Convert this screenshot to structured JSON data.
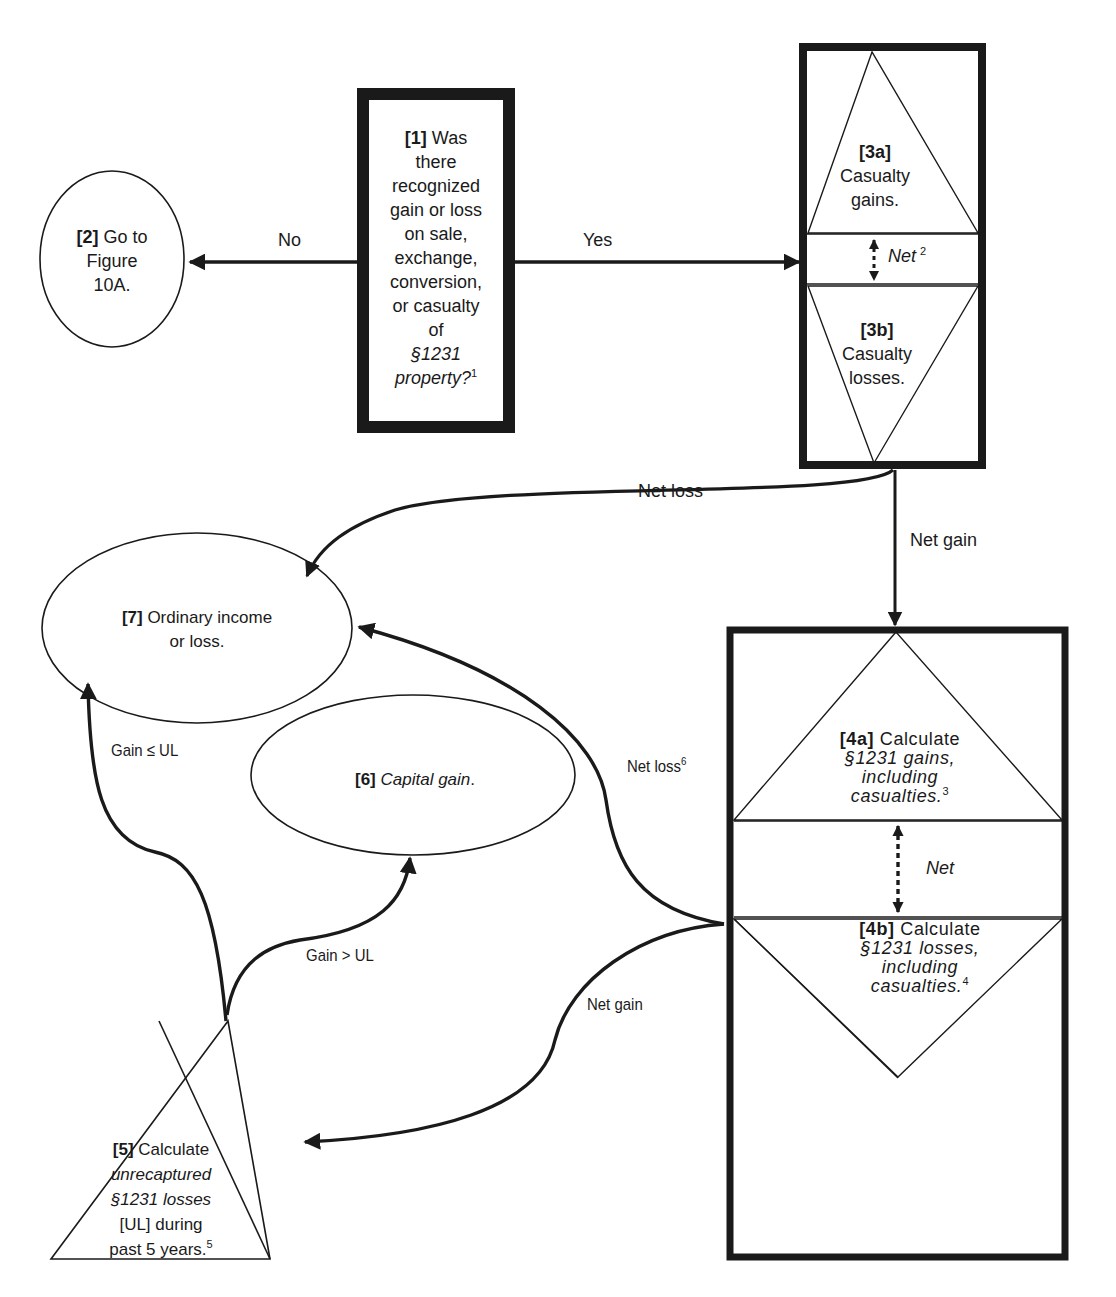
{
  "diagram": {
    "type": "flowchart",
    "colors": {
      "stroke": "#1a1a1a",
      "background": "#ffffff",
      "text": "#1a1a1a"
    },
    "nodes": {
      "n1": {
        "num": "[1]",
        "lines": [
          "Was",
          "there",
          "recognized",
          "gain or loss",
          "on sale,",
          "exchange,",
          "conversion,",
          "or casualty",
          "of"
        ],
        "italic_line": "§1231",
        "italic_line2": "property?",
        "footnote": "1",
        "shape": "thick-rectangle"
      },
      "n2": {
        "num": "[2]",
        "line1": "Go to",
        "line2": "Figure",
        "line3": "10A.",
        "shape": "ellipse"
      },
      "n3a": {
        "num": "[3a]",
        "line1": "Casualty",
        "line2": "gains.",
        "shape": "triangle-up"
      },
      "n3b": {
        "num": "[3b]",
        "line1": "Casualty",
        "line2": "losses.",
        "shape": "triangle-down"
      },
      "n3net": {
        "label": "Net",
        "footnote": "2"
      },
      "n4a": {
        "num": "[4a]",
        "line1": "Calculate",
        "line2": "§1231 gains,",
        "line3": "including",
        "line4": "casualties.",
        "footnote": "3",
        "shape": "triangle-up"
      },
      "n4b": {
        "num": "[4b]",
        "line1": "Calculate",
        "line2": "§1231 losses,",
        "line3": "including",
        "line4": "casualties.",
        "footnote": "4",
        "shape": "triangle-down"
      },
      "n4net": {
        "label": "Net"
      },
      "n5": {
        "num": "[5]",
        "line1": "Calculate",
        "line2": "unrecaptured",
        "line3": "§1231 losses",
        "line4": "[UL] during",
        "line5": "past 5 years.",
        "footnote": "5",
        "shape": "triangle-up"
      },
      "n6": {
        "num": "[6]",
        "label": "Capital gain",
        "suffix": ".",
        "shape": "ellipse"
      },
      "n7": {
        "num": "[7]",
        "line1": "Ordinary income",
        "line2": "or loss.",
        "shape": "ellipse"
      }
    },
    "edges": {
      "no": {
        "label": "No",
        "from": "n1",
        "to": "n2"
      },
      "yes": {
        "label": "Yes",
        "from": "n1",
        "to": "n3"
      },
      "net_loss_3": {
        "label": "Net loss",
        "from": "n3",
        "to": "n7"
      },
      "net_gain_3": {
        "label": "Net gain",
        "from": "n3",
        "to": "n4"
      },
      "net_loss_4": {
        "label": "Net loss",
        "footnote": "6",
        "from": "n4",
        "to": "n7"
      },
      "net_gain_4": {
        "label": "Net gain",
        "from": "n4",
        "to": "n5"
      },
      "gain_le_ul": {
        "label": "Gain ≤ UL",
        "from": "n5",
        "to": "n7"
      },
      "gain_gt_ul": {
        "label": "Gain > UL",
        "from": "n5",
        "to": "n6"
      }
    }
  }
}
